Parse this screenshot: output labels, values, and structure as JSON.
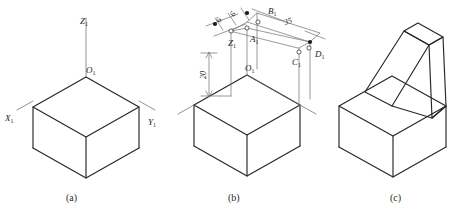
{
  "figure": {
    "background_color": "#ffffff",
    "line_color": "#262626",
    "construction_color": "#6e6e6e"
  },
  "panels": [
    {
      "caption": "(a)",
      "description": "Isometric axes with base box",
      "axis_labels": {
        "z": "Z",
        "z_sub": "1",
        "x": "X",
        "x_sub": "1",
        "y": "Y",
        "y_sub": "1",
        "origin": "O",
        "origin_sub": "1"
      }
    },
    {
      "caption": "(b)",
      "description": "Base box with construction points and dimensions",
      "point_labels": [
        {
          "name": "A",
          "sub": "1"
        },
        {
          "name": "B",
          "sub": "1"
        },
        {
          "name": "C",
          "sub": "1"
        },
        {
          "name": "D",
          "sub": "1"
        },
        {
          "name": "Z",
          "sub": "1"
        },
        {
          "name": "O",
          "sub": "1"
        }
      ],
      "dimensions": [
        {
          "value": "6",
          "orientation": "oblique",
          "id": "dim-6-left"
        },
        {
          "value": "6",
          "orientation": "oblique",
          "id": "dim-6-right"
        },
        {
          "value": "35",
          "orientation": "oblique",
          "id": "dim-35"
        },
        {
          "value": "20",
          "orientation": "vertical",
          "id": "dim-20"
        }
      ]
    },
    {
      "caption": "(c)",
      "description": "Completed solid with sloped back rest",
      "point_labels": [],
      "dimensions": []
    }
  ]
}
